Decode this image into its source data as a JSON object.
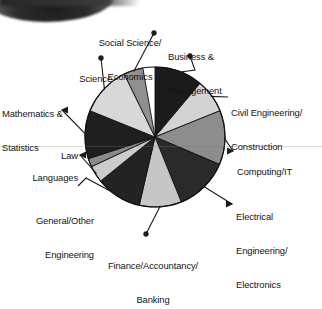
{
  "chart_data": {
    "type": "pie",
    "title": "",
    "subtitle": "",
    "xlabel": "",
    "ylabel": "",
    "legend_position": "none",
    "labels_position": "outside-with-leader-lines",
    "grid": false,
    "start_angle_deg": 0,
    "direction": "clockwise",
    "categories": [
      "Business & Management",
      "Civil Engineering/Construction",
      "Computing/IT",
      "Electrical Engineering/Electronics",
      "Finance/Accountancy/Banking",
      "General/Other Engineering",
      "Languages",
      "Law",
      "Mathematics & Statistics",
      "Science",
      "Social Science/Economics"
    ],
    "values": [
      11.1,
      7.8,
      12.5,
      12.5,
      9.7,
      10.6,
      3.9,
      1.9,
      11.1,
      11.7,
      4.4
    ],
    "angles_deg": [
      40,
      28,
      45,
      45,
      35,
      38,
      14,
      7,
      40,
      42,
      16
    ],
    "slices": [
      {
        "label": "Business & Management",
        "value": 11.1,
        "angle_deg": 40,
        "fill": "#1b1b1b"
      },
      {
        "label": "Civil Engineering/Construction",
        "value": 7.8,
        "angle_deg": 28,
        "fill": "#d3d3d3"
      },
      {
        "label": "Computing/IT",
        "value": 12.5,
        "angle_deg": 45,
        "fill": "#8d8d8d"
      },
      {
        "label": "Electrical Engineering/Electronics",
        "value": 12.5,
        "angle_deg": 45,
        "fill": "#2a2a2a"
      },
      {
        "label": "Finance/Accountancy/Banking",
        "value": 9.7,
        "angle_deg": 35,
        "fill": "#c6c6c6"
      },
      {
        "label": "General/Other Engineering",
        "value": 10.6,
        "angle_deg": 38,
        "fill": "#232323"
      },
      {
        "label": "Languages",
        "value": 3.9,
        "angle_deg": 14,
        "fill": "#cccccc"
      },
      {
        "label": "Law",
        "value": 1.9,
        "angle_deg": 7,
        "fill": "#8a8a8a"
      },
      {
        "label": "Mathematics & Statistics",
        "value": 11.1,
        "angle_deg": 40,
        "fill": "#1f1f1f"
      },
      {
        "label": "Science",
        "value": 11.7,
        "angle_deg": 42,
        "fill": "#d8d8d8"
      },
      {
        "label": "Social Science/Economics",
        "value": 4.4,
        "angle_deg": 16,
        "fill": "#909090"
      }
    ]
  },
  "labels": {
    "social_science": {
      "line1": "Social Science/",
      "line2": "Economics"
    },
    "business": {
      "line1": "Business &",
      "line2": "Management"
    },
    "civil": {
      "line1": "Civil Engineering/",
      "line2": "Construction"
    },
    "computing": {
      "line1": "Computing/IT",
      "line2": ""
    },
    "electrical": {
      "line1": "Electrical",
      "line2": "Engineering/",
      "line3": "Electronics"
    },
    "finance": {
      "line1": "Finance/Accountancy/",
      "line2": "Banking"
    },
    "general": {
      "line1": "General/Other",
      "line2": "Engineering"
    },
    "languages": {
      "line1": "Languages",
      "line2": ""
    },
    "law": {
      "line1": "Law",
      "line2": ""
    },
    "mathematics": {
      "line1": "Mathematics &",
      "line2": "Statistics"
    },
    "science": {
      "line1": "Science",
      "line2": ""
    }
  },
  "colors": {
    "black": "#1b1b1b",
    "dark_gray": "#2a2a2a",
    "mid_gray": "#8d8d8d",
    "light_gray": "#d3d3d3",
    "background": "#ffffff",
    "leader_line": "#1a1a1a"
  }
}
